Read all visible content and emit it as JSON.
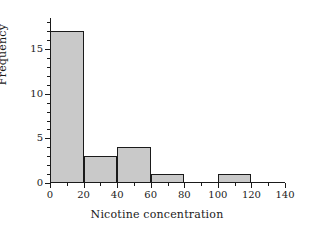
{
  "chart_data": {
    "type": "bar",
    "title": "",
    "subtitle": "",
    "xlabel": "Nicotine concentration",
    "ylabel": "Frequency",
    "categories": [
      "0-20",
      "20-40",
      "40-60",
      "60-80",
      "80-100",
      "100-120",
      "120-140"
    ],
    "bin_edges": [
      0,
      20,
      40,
      60,
      80,
      100,
      120,
      140
    ],
    "values": [
      17,
      3,
      4,
      1,
      0,
      1,
      0
    ],
    "xlim": [
      0,
      140
    ],
    "ylim": [
      0,
      18.5
    ],
    "x_ticks": [
      0,
      20,
      40,
      60,
      80,
      100,
      120,
      140
    ],
    "x_tick_labels": [
      "0",
      "20",
      "40",
      "60",
      "80",
      "100",
      "120",
      "140"
    ],
    "x_minor_ticks": [
      10,
      30,
      50,
      70,
      90,
      110,
      130
    ],
    "y_ticks": [
      0,
      5,
      10,
      15
    ],
    "y_tick_labels": [
      "0",
      "5",
      "10",
      "15"
    ],
    "y_minor_ticks": [
      1,
      2,
      3,
      4,
      6,
      7,
      8,
      9,
      11,
      12,
      13,
      14,
      16,
      17,
      18
    ],
    "grid": false,
    "legend": null,
    "bar_fill_color": "#c9c9c9",
    "bar_edge_color": "#1a1a1a",
    "axis_color": "#1a1a1a",
    "background_color": "#ffffff"
  }
}
